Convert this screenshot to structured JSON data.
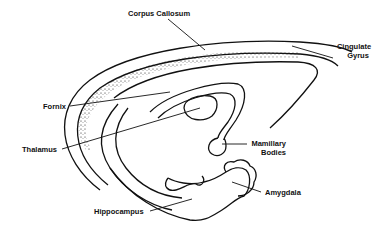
{
  "diagram": {
    "labels": {
      "corpus_callosum": "Corpus Callosum",
      "cingulate_gyrus_line1": "Cingulate",
      "cingulate_gyrus_line2": "Gyrus",
      "fornix": "Fornix",
      "thalamus": "Thalamus",
      "mamillary_bodies_line1": "Mamillary",
      "mamillary_bodies_line2": "Bodies",
      "amygdala": "Amygdala",
      "hippocampus": "Hippocampus"
    },
    "colors": {
      "ink": "#111111",
      "background": "#ffffff"
    }
  }
}
